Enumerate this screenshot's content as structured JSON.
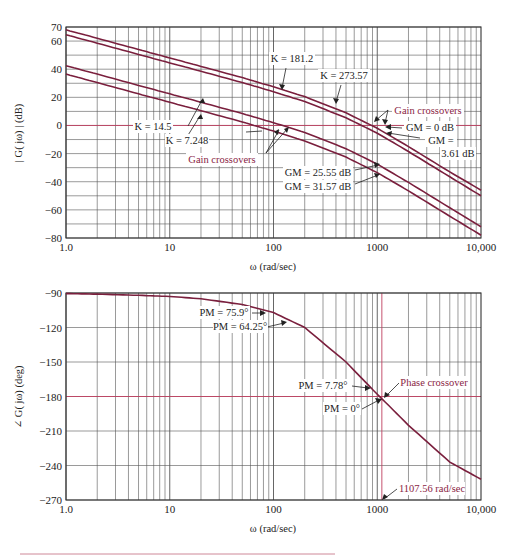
{
  "chart_data": [
    {
      "type": "line",
      "title": "",
      "xlabel": "ω (rad/sec)",
      "ylabel": "|G(jω)| (dB)",
      "xscale": "log",
      "xlim": [
        1,
        10000
      ],
      "ylim": [
        -80,
        70
      ],
      "grid": true,
      "x_ticks": [
        "1.0",
        "10",
        "100",
        "1000",
        "10,000"
      ],
      "y_ticks": [
        "70",
        "60",
        "40",
        "20",
        "0",
        "-20",
        "-40",
        "-60",
        "-80"
      ],
      "y_tick_values": [
        70,
        60,
        40,
        20,
        0,
        -20,
        -40,
        -60,
        -80
      ],
      "x": [
        1,
        2,
        5,
        10,
        20,
        50,
        100,
        200,
        500,
        1000,
        2000,
        5000,
        10000
      ],
      "series": [
        {
          "name": "K = 273.57",
          "values": [
            68,
            62,
            54,
            48,
            42,
            34,
            27.5,
            20.5,
            9,
            -2,
            -15,
            -33,
            -46
          ]
        },
        {
          "name": "K = 181.2",
          "values": [
            64.5,
            58.5,
            50.5,
            44.5,
            38.5,
            30.5,
            24,
            17,
            5.5,
            -5.5,
            -18.5,
            -36.5,
            -50
          ]
        },
        {
          "name": "K = 14.5",
          "values": [
            42.5,
            36.5,
            28.5,
            22.5,
            16.5,
            8.5,
            2,
            -5,
            -16.5,
            -27.5,
            -40.5,
            -58.5,
            -72
          ]
        },
        {
          "name": "K = 7.248",
          "values": [
            36.5,
            30.5,
            22.5,
            16.5,
            10.5,
            2.5,
            -4,
            -11,
            -22.5,
            -33.5,
            -46.5,
            -64.5,
            -78
          ]
        }
      ],
      "annotations": [
        {
          "text": "K = 181.2"
        },
        {
          "text": "K = 273.57"
        },
        {
          "text": "K = 14.5"
        },
        {
          "text": "K = 7.248"
        },
        {
          "text": "Gain crossovers",
          "color": "#8a2444"
        },
        {
          "text": "Gain crossovers",
          "color": "#8a2444"
        },
        {
          "text": "GM = 0 dB"
        },
        {
          "text": "GM = 3.61 dB"
        },
        {
          "text": "GM = 25.55 dB"
        },
        {
          "text": "GM = 31.57 dB"
        }
      ]
    },
    {
      "type": "line",
      "title": "",
      "xlabel": "ω (rad/sec)",
      "ylabel": "∠G(jω) (deg)",
      "xscale": "log",
      "xlim": [
        1,
        10000
      ],
      "ylim": [
        -270,
        -90
      ],
      "grid": true,
      "x_ticks": [
        "1.0",
        "10",
        "100",
        "1000",
        "10,000"
      ],
      "y_ticks": [
        "-90",
        "-120",
        "-150",
        "-180",
        "-210",
        "-240",
        "-270"
      ],
      "y_tick_values": [
        -90,
        -120,
        -150,
        -180,
        -210,
        -240,
        -270
      ],
      "x": [
        1,
        2,
        5,
        10,
        20,
        50,
        100,
        200,
        500,
        1000,
        2000,
        5000,
        10000
      ],
      "series": [
        {
          "name": "Phase",
          "values": [
            -90.5,
            -91,
            -92,
            -93,
            -95,
            -100,
            -107,
            -120,
            -150,
            -178,
            -205,
            -237,
            -252
          ]
        }
      ],
      "annotations": [
        {
          "text": "PM = 75.9°"
        },
        {
          "text": "PM = 64.25°"
        },
        {
          "text": "PM = 7.78°"
        },
        {
          "text": "PM = 0°"
        },
        {
          "text": "Phase crossover",
          "color": "#8a2444"
        },
        {
          "text": "1107.56 rad/sec",
          "color": "#8a2444"
        }
      ]
    }
  ],
  "labels": {
    "mag_ylabel": "| G( jω) | (dB)",
    "phase_ylabel": "∠ G( jω) (deg)",
    "xlabel": "ω (rad/sec)",
    "k1": "K = 181.2",
    "k2": "K = 273.57",
    "k3": "K = 14.5",
    "k4": "K = 7.248",
    "gain_cross": "Gain crossovers",
    "gm0": "GM = 0 dB",
    "gm361a": "GM =",
    "gm361b": "3.61 dB",
    "gm2555": "GM = 25.55 dB",
    "gm3157": "GM = 31.57 dB",
    "pm759": "PM = 75.9°",
    "pm6425": "PM = 64.25°",
    "pm778": "PM = 7.78°",
    "pm0": "PM = 0°",
    "phase_cross": "Phase crossover",
    "freq": "1107.56 rad/sec"
  },
  "colors": {
    "curve": "#7a1f3d",
    "annotation_red": "#8a2444",
    "grid": "#555555",
    "highlight_line": "#c04060"
  }
}
